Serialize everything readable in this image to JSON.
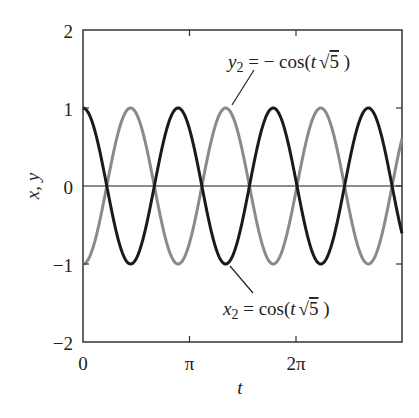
{
  "chart_data": {
    "type": "line",
    "title": "",
    "xlabel": "t",
    "ylabel": "x, y",
    "xlim": [
      0,
      9.4248
    ],
    "ylim": [
      -2,
      2
    ],
    "grid": false,
    "legend": "none (inline annotations)",
    "x_ticks": [
      {
        "value": 0,
        "label": "0"
      },
      {
        "value": 3.14159,
        "label": "π"
      },
      {
        "value": 6.28319,
        "label": "2π"
      }
    ],
    "y_ticks": [
      {
        "value": 2,
        "label": "2"
      },
      {
        "value": 1,
        "label": "1"
      },
      {
        "value": 0,
        "label": "0"
      },
      {
        "value": -1,
        "label": "−1"
      },
      {
        "value": -2,
        "label": "−2"
      }
    ],
    "series": [
      {
        "name": "x2",
        "label": "x₂ = cos(t √5)",
        "formula": "cos(t*sqrt(5))",
        "color": "#1a1a1a",
        "amp": 1,
        "omega": 2.236068,
        "phase_sign": 1
      },
      {
        "name": "y2",
        "label": "y₂ = − cos(t √5)",
        "formula": "-cos(t*sqrt(5))",
        "color": "#8a8a8a",
        "amp": -1,
        "omega": 2.236068,
        "phase_sign": -1
      }
    ],
    "reference_lines": [
      {
        "type": "horizontal",
        "y": 0,
        "color": "#1a1a1a"
      }
    ]
  },
  "annotations": {
    "y2": {
      "var": "y",
      "sub": "2",
      "rhs": " = − cos(",
      "t": "t",
      "sqrt": "√",
      "five": "5",
      "close": " )"
    },
    "x2": {
      "var": "x",
      "sub": "2",
      "rhs": " = cos(",
      "t": "t",
      "sqrt": "√",
      "five": "5",
      "close": " )"
    }
  },
  "axes": {
    "xlabel": "t",
    "ylabel": "x, y",
    "x_tick_labels": [
      "0",
      "π",
      "2π"
    ],
    "y_tick_labels": [
      "2",
      "1",
      "0",
      "−1",
      "−2"
    ]
  }
}
